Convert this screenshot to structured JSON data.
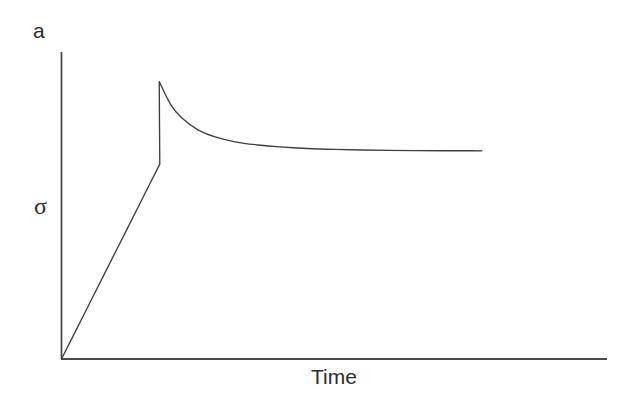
{
  "figure": {
    "panel_label": "a",
    "background_color": "#ffffff",
    "line_color": "#4a4a4a",
    "text_color": "#2b2b2b",
    "width": 620,
    "height": 412
  },
  "chart_data": {
    "type": "line",
    "title": "",
    "subtitle": "",
    "panel_label": "a",
    "xlabel": "Time",
    "ylabel": "σ",
    "grid": false,
    "legend": null,
    "axis_style": "open-corner",
    "xlim": [
      0,
      1
    ],
    "ylim": [
      0,
      1
    ],
    "x_tick_labels": [],
    "y_tick_labels": [],
    "annotations": [],
    "series": [
      {
        "name": "stress response",
        "description": "linear elastic loading to a yield peak, followed by strain softening that relaxes to a steady-state plateau",
        "x": [
          0.0,
          0.02,
          0.04,
          0.06,
          0.08,
          0.1,
          0.12,
          0.14,
          0.16,
          0.18,
          0.179,
          0.2,
          0.22,
          0.25,
          0.28,
          0.32,
          0.36,
          0.4,
          0.45,
          0.5,
          0.55,
          0.6,
          0.65,
          0.7,
          0.75,
          0.77
        ],
        "y": [
          0.0,
          0.0705,
          0.141,
          0.2116,
          0.2821,
          0.3526,
          0.4231,
          0.4936,
          0.5642,
          0.6347,
          0.9035,
          0.8285,
          0.7855,
          0.7465,
          0.7244,
          0.7066,
          0.6971,
          0.6908,
          0.6856,
          0.6826,
          0.6808,
          0.6796,
          0.6789,
          0.6784,
          0.6782,
          0.6781
        ]
      }
    ]
  },
  "labels": {
    "panel": "a",
    "y_axis": "σ",
    "x_axis": "Time"
  }
}
